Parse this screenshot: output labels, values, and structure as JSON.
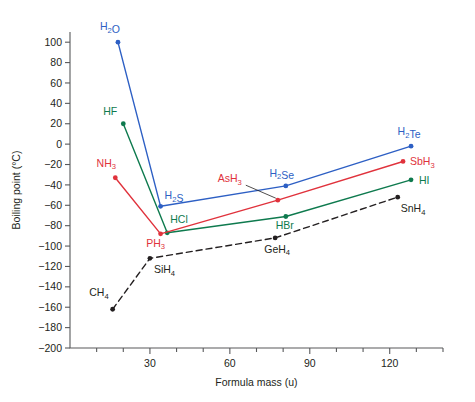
{
  "chart_data": {
    "type": "line",
    "title": "",
    "xlabel": "Formula mass (u)",
    "ylabel": "Boiling point (°C)",
    "xlim": [
      0,
      140
    ],
    "ylim": [
      -200,
      110
    ],
    "xticks": [
      30,
      60,
      90,
      120
    ],
    "xticks_labels": [
      "30",
      "60",
      "90",
      "120"
    ],
    "xminor_step": 10,
    "yticks": [
      100,
      80,
      60,
      40,
      20,
      0,
      -20,
      -40,
      -60,
      -80,
      -100,
      -120,
      -140,
      -160,
      -180,
      -200
    ],
    "yticks_labels": [
      "100",
      "80",
      "60",
      "40",
      "20",
      "0",
      "−20",
      "−40",
      "−60",
      "−80",
      "−100",
      "−120",
      "−140",
      "−160",
      "−180",
      "−200"
    ],
    "grid": false,
    "legend": "none",
    "series": [
      {
        "name": "Group 16 hydrides",
        "color": "#2d5fc4",
        "dashed": false,
        "points": [
          {
            "label": "H2O",
            "label_html": "H<sub>2</sub>O",
            "x": 18,
            "y": 100,
            "label_dx": -8,
            "label_dy": -12,
            "anchor": "middle"
          },
          {
            "label": "H2S",
            "label_html": "H<sub>2</sub>S",
            "x": 34,
            "y": -61,
            "label_dx": 4,
            "label_dy": -7,
            "anchor": "start"
          },
          {
            "label": "H2Se",
            "label_html": "H<sub>2</sub>Se",
            "x": 81,
            "y": -41,
            "label_dx": -4,
            "label_dy": -9,
            "anchor": "middle"
          },
          {
            "label": "H2Te",
            "label_html": "H<sub>2</sub>Te",
            "x": 128,
            "y": -2,
            "label_dx": -2,
            "label_dy": -11,
            "anchor": "middle"
          }
        ]
      },
      {
        "name": "Group 17 hydrides",
        "color": "#0e7a4e",
        "dashed": false,
        "points": [
          {
            "label": "HF",
            "label_html": "HF",
            "x": 20,
            "y": 20,
            "label_dx": -13,
            "label_dy": -9,
            "anchor": "middle"
          },
          {
            "label": "HCl",
            "label_html": "HCl",
            "x": 36.5,
            "y": -87,
            "label_dx": 3,
            "label_dy": -10,
            "anchor": "start"
          },
          {
            "label": "HBr",
            "label_html": "HBr",
            "x": 81,
            "y": -71,
            "label_dx": -1,
            "label_dy": 12,
            "anchor": "middle"
          },
          {
            "label": "HI",
            "label_html": "HI",
            "x": 128,
            "y": -35,
            "label_dx": 8,
            "label_dy": 4,
            "anchor": "start"
          }
        ]
      },
      {
        "name": "Group 15 hydrides",
        "color": "#e0323c",
        "dashed": false,
        "points": [
          {
            "label": "NH3",
            "label_html": "NH<sub>3</sub>",
            "x": 17,
            "y": -33,
            "label_dx": -9,
            "label_dy": -11,
            "anchor": "middle"
          },
          {
            "label": "PH3",
            "label_html": "PH<sub>3</sub>",
            "x": 34,
            "y": -88,
            "label_dx": -5,
            "label_dy": 13,
            "anchor": "middle"
          },
          {
            "label": "AsH3",
            "label_html": "AsH<sub>3</sub>",
            "x": 78,
            "y": -55,
            "label_dx": -48,
            "label_dy": -18,
            "anchor": "middle",
            "leader": true
          },
          {
            "label": "SbH3",
            "label_html": "SbH<sub>3</sub>",
            "x": 125,
            "y": -17,
            "label_dx": 7,
            "label_dy": 4,
            "anchor": "start"
          }
        ]
      },
      {
        "name": "Group 14 hydrides",
        "color": "#231f20",
        "dashed": true,
        "points": [
          {
            "label": "CH4",
            "label_html": "CH<sub>4</sub>",
            "x": 16,
            "y": -162,
            "label_dx": -4,
            "label_dy": -13,
            "anchor": "end"
          },
          {
            "label": "SiH4",
            "label_html": "SiH<sub>4</sub>",
            "x": 30,
            "y": -112,
            "label_dx": 4,
            "label_dy": 15,
            "anchor": "start"
          },
          {
            "label": "GeH4",
            "label_html": "GeH<sub>4</sub>",
            "x": 77,
            "y": -92,
            "label_dx": 2,
            "label_dy": 15,
            "anchor": "middle"
          },
          {
            "label": "SnH4",
            "label_html": "SnH<sub>4</sub>",
            "x": 123,
            "y": -52,
            "label_dx": 3,
            "label_dy": 15,
            "anchor": "start"
          }
        ]
      }
    ]
  }
}
